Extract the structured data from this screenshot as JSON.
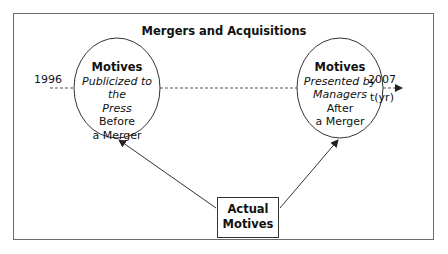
{
  "diagram": {
    "title": "Mergers and Acquisitions",
    "timeline": {
      "start_label": "1996",
      "end_label": "2007",
      "axis_label": "t(yr)",
      "style": "dashed"
    },
    "nodes": {
      "left": {
        "shape": "ellipse",
        "heading": "Motives",
        "italic_line1": "Publicized to the",
        "italic_line2": "Press",
        "line3": "Before",
        "line4": "a Merger"
      },
      "right": {
        "shape": "ellipse",
        "heading": "Motives",
        "italic_line1": "Presented by",
        "italic_line2": "Managers",
        "line3": "After",
        "line4": "a Merger"
      },
      "bottom": {
        "shape": "rectangle",
        "line1": "Actual",
        "line2": "Motives"
      }
    },
    "edges": [
      {
        "from": "Actual Motives",
        "to": "Motives Publicized to the Press Before a Merger"
      },
      {
        "from": "Actual Motives",
        "to": "Motives Presented by Managers After a Merger"
      }
    ],
    "colors": {
      "line": "#333333",
      "frame": "#6b6b6b",
      "text": "#111111",
      "background": "#ffffff"
    }
  }
}
